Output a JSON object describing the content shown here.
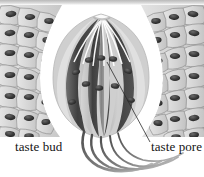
{
  "figure": {
    "title": "taste bud",
    "type": "histological-illustration",
    "style": "grayscale halftone engraving",
    "background_color": "#ffffff",
    "top_band_color": "#c4c4c4"
  },
  "labels": {
    "taste_bud": "taste bud",
    "taste_pore": "taste pore"
  },
  "colors": {
    "epithelium_fill": "#d8d8d8",
    "epithelium_outline": "#8c8c8c",
    "nucleus_dark": "#3a3a3a",
    "taste_cell_dark": "#4a4a4a",
    "taste_cell_mid": "#8e8e8e",
    "taste_cell_light": "#c9c9c9",
    "bud_halo": "#fbfbfb",
    "nerve_fiber": "#6b6b6b",
    "leader_line": "#2a2a2a",
    "text": "#141414"
  },
  "structures": {
    "taste_pore_position": {
      "x": 102,
      "y": 20
    },
    "bud_center": {
      "x": 101,
      "y": 78
    },
    "bud_width": 96,
    "bud_height": 112,
    "taste_cell_count": 7,
    "nerve_fiber_count": 5
  },
  "leader_line": {
    "from": {
      "x": 150,
      "y": 142
    },
    "to": {
      "x": 107,
      "y": 62
    }
  }
}
